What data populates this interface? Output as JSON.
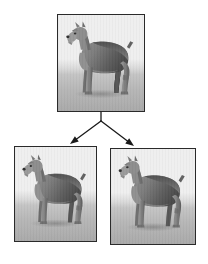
{
  "diagram": {
    "type": "tree",
    "orientation": "top-down",
    "background_color": "#ffffff",
    "node_count": 3,
    "edge_count": 2
  },
  "nodes": [
    {
      "id": "parent",
      "role": "root",
      "label": "",
      "content_type": "rendered-image",
      "subject": "dog",
      "breed_look": "schnauzer-terrier",
      "pose": "standing profile facing left",
      "rendering": "grayscale 3D shaded model",
      "frame": {
        "x": 57,
        "y": 14,
        "width": 88,
        "height": 98
      },
      "border_color": "#2a2a2a",
      "background_top_color": "#efefef",
      "background_bottom_color": "#a9a9a9",
      "body_light_color": "#9a9a9a",
      "body_dark_color": "#5d5d5d",
      "body_shadow_color": "#424242"
    },
    {
      "id": "child-left",
      "role": "leaf",
      "label": "",
      "content_type": "rendered-image",
      "subject": "dog",
      "breed_look": "schnauzer-terrier",
      "pose": "standing profile facing left",
      "rendering": "grayscale 3D shaded model",
      "frame": {
        "x": 14,
        "y": 146,
        "width": 83,
        "height": 96
      },
      "border_color": "#2a2a2a",
      "background_top_color": "#efefef",
      "background_bottom_color": "#a9a9a9",
      "body_light_color": "#9a9a9a",
      "body_dark_color": "#5d5d5d",
      "body_shadow_color": "#424242"
    },
    {
      "id": "child-right",
      "role": "leaf",
      "label": "",
      "content_type": "rendered-image",
      "subject": "dog",
      "breed_look": "schnauzer-terrier",
      "pose": "standing profile facing left",
      "rendering": "grayscale 3D shaded model",
      "frame": {
        "x": 110,
        "y": 148,
        "width": 86,
        "height": 97
      },
      "border_color": "#2a2a2a",
      "background_top_color": "#efefef",
      "background_bottom_color": "#a9a9a9",
      "body_light_color": "#9a9a9a",
      "body_dark_color": "#5d5d5d",
      "body_shadow_color": "#424242"
    }
  ],
  "edges": [
    {
      "id": "edge-stem",
      "from": "parent",
      "to": "branch-point",
      "label": "",
      "kind": "line",
      "arrowhead": false,
      "color": "#1a1a1a",
      "x1": 101,
      "y1": 112,
      "x2": 101,
      "y2": 121
    },
    {
      "id": "edge-left",
      "from": "parent",
      "to": "child-left",
      "label": "",
      "kind": "arrow",
      "arrowhead": true,
      "color": "#1a1a1a",
      "x1": 101,
      "y1": 121,
      "x2": 70,
      "y2": 144
    },
    {
      "id": "edge-right",
      "from": "parent",
      "to": "child-right",
      "label": "",
      "kind": "arrow",
      "arrowhead": true,
      "color": "#1a1a1a",
      "x1": 101,
      "y1": 121,
      "x2": 134,
      "y2": 146
    }
  ],
  "icons": {
    "arrow_left": "arrow-down-left-icon",
    "arrow_right": "arrow-down-right-icon"
  }
}
